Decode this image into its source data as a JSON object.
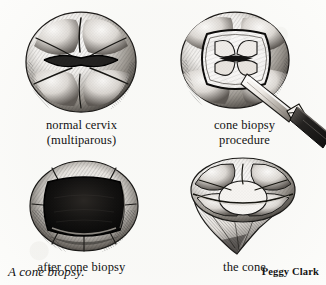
{
  "figure": {
    "title": "A cone biopsy.",
    "credit": "Peggy Clark",
    "medium": "pen-and-ink stipple and hatching medical illustration",
    "background_color": "#fcfcfa",
    "ink_color": "#141414"
  },
  "panels": [
    {
      "id": "normal-cervix",
      "position": "top-left",
      "caption_line1": "normal cervix",
      "caption_line2": "(multiparous)",
      "subject": "rounded multiparous cervix with transverse slit os and radiating lobes"
    },
    {
      "id": "cone-biopsy-procedure",
      "position": "top-right",
      "caption_line1": "cone biopsy",
      "caption_line2": "procedure",
      "subject": "cervix with scalpel blade incising a rounded-square cone outline"
    },
    {
      "id": "after-cone-biopsy",
      "position": "bottom-left",
      "caption_line1": "after cone biopsy",
      "caption_line2": "",
      "subject": "cervix with dark excised crater cavity"
    },
    {
      "id": "the-cone",
      "position": "bottom-right",
      "caption_line1": "the cone",
      "caption_line2": "",
      "subject": "excised conical tissue specimen with lobed top tapering to a point"
    }
  ]
}
